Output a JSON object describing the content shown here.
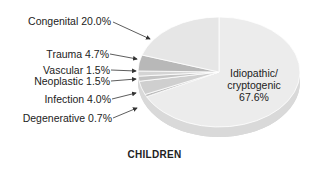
{
  "chart_data": {
    "type": "pie",
    "title": "CHILDREN",
    "categories": [
      "Idiopathic/cryptogenic",
      "Degenerative",
      "Infection",
      "Neoplastic",
      "Vascular",
      "Trauma",
      "Congenital"
    ],
    "values": [
      67.6,
      0.7,
      4.0,
      1.5,
      1.5,
      4.7,
      20.0
    ],
    "unit": "%",
    "style": "3d-pie, grayscale"
  },
  "labels": {
    "congenital": "Congenital 20.0%",
    "trauma": "Trauma 4.7%",
    "vascular": "Vascular 1.5%",
    "neoplastic": "Neoplastic 1.5%",
    "infection": "Infection 4.0%",
    "degenerative": "Degenerative 0.7%",
    "idiopathic_line1": "Idiopathic/",
    "idiopathic_line2": "cryptogenic",
    "idiopathic_line3": "67.6%"
  },
  "title": "CHILDREN",
  "colors": {
    "idiopathic": "#ececec",
    "congenital": "#e6e6e6",
    "trauma": "#b8b8b8",
    "vascular": "#d4d4d4",
    "neoplastic": "#c4c4c4",
    "infection": "#cfcfcf",
    "degenerative": "#bdbdbd",
    "side": "#d9d9d9",
    "arrow": "#333333"
  }
}
